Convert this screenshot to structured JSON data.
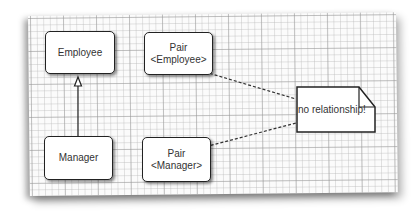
{
  "diagram": {
    "type": "UML class diagram",
    "boxes": {
      "employee": {
        "line1": "Employee",
        "line2": ""
      },
      "pair_employee": {
        "line1": "Pair",
        "line2": "<Employee>"
      },
      "manager": {
        "line1": "Manager",
        "line2": ""
      },
      "pair_manager": {
        "line1": "Pair",
        "line2": "<Manager>"
      }
    },
    "note": {
      "text": "no relationship!"
    },
    "relations": [
      {
        "from": "Manager",
        "to": "Employee",
        "kind": "inheritance"
      },
      {
        "from": "Pair<Employee>",
        "to": "note",
        "kind": "dashed"
      },
      {
        "from": "Pair<Manager>",
        "to": "note",
        "kind": "dashed"
      }
    ],
    "colors": {
      "line": "#222222",
      "box_fill": "#ffffff",
      "grid": "#bbbbbb"
    }
  }
}
